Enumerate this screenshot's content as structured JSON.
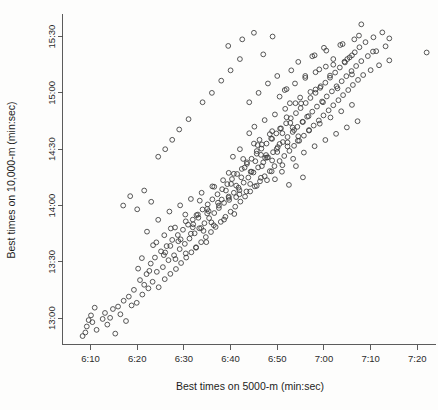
{
  "chart_data": {
    "type": "scatter",
    "title": "",
    "xlabel": "Best times on 5000-m (min:sec)",
    "ylabel": "Best times on 10,000-m (min:sec)",
    "xtick_labels": [
      "6:10",
      "6:20",
      "6:30",
      "6:40",
      "6:50",
      "7:00",
      "7:10",
      "7:20"
    ],
    "xtick_values": [
      370,
      380,
      390,
      400,
      410,
      420,
      430,
      440
    ],
    "ytick_labels": [
      "13:00",
      "13:30",
      "14:00",
      "14:30",
      "15:00",
      "15:30"
    ],
    "ytick_values": [
      780,
      810,
      840,
      870,
      900,
      930
    ],
    "xlim": [
      364,
      444
    ],
    "ylim": [
      766,
      942
    ],
    "grid": false,
    "legend": false,
    "marker": "open-circle",
    "marker_color": "#3a3a3a",
    "n_points": 330,
    "x_units": "seconds (5000-m best time)",
    "y_units": "seconds (10,000-m best time)",
    "points": [
      [
        368.3,
        770.5
      ],
      [
        368.9,
        772.4
      ],
      [
        369.2,
        775.6
      ],
      [
        369.6,
        779.0
      ],
      [
        370.1,
        781.5
      ],
      [
        370.4,
        777.9
      ],
      [
        370.9,
        785.6
      ],
      [
        371.3,
        773.8
      ],
      [
        372.6,
        779.6
      ],
      [
        373.1,
        782.8
      ],
      [
        373.6,
        776.6
      ],
      [
        374.2,
        780.2
      ],
      [
        374.8,
        784.9
      ],
      [
        375.3,
        771.8
      ],
      [
        375.9,
        786.2
      ],
      [
        376.4,
        782.1
      ],
      [
        377.1,
        789.3
      ],
      [
        377.6,
        778.5
      ],
      [
        378.2,
        791.5
      ],
      [
        378.8,
        786.8
      ],
      [
        379.3,
        795.1
      ],
      [
        379.9,
        788.2
      ],
      [
        380.2,
        806.4
      ],
      [
        380.6,
        800.3
      ],
      [
        381.1,
        792.6
      ],
      [
        381.5,
        797.8
      ],
      [
        382.0,
        803.5
      ],
      [
        382.4,
        795.9
      ],
      [
        382.9,
        809.1
      ],
      [
        383.3,
        799.4
      ],
      [
        383.8,
        812.3
      ],
      [
        384.2,
        804.7
      ],
      [
        384.6,
        796.5
      ],
      [
        385.1,
        815.6
      ],
      [
        385.5,
        807.2
      ],
      [
        385.9,
        800.8
      ],
      [
        386.3,
        818.4
      ],
      [
        386.7,
        810.9
      ],
      [
        387.1,
        803.6
      ],
      [
        387.5,
        821.7
      ],
      [
        387.9,
        813.5
      ],
      [
        388.3,
        806.2
      ],
      [
        388.7,
        824.3
      ],
      [
        389.1,
        816.8
      ],
      [
        389.4,
        809.4
      ],
      [
        389.8,
        827.1
      ],
      [
        390.2,
        819.6
      ],
      [
        390.5,
        812.3
      ],
      [
        390.9,
        829.8
      ],
      [
        391.2,
        822.4
      ],
      [
        391.6,
        815.1
      ],
      [
        391.9,
        832.5
      ],
      [
        392.3,
        825.2
      ],
      [
        392.6,
        817.8
      ],
      [
        393.0,
        835.2
      ],
      [
        393.3,
        827.9
      ],
      [
        393.7,
        820.5
      ],
      [
        394.0,
        837.9
      ],
      [
        394.4,
        830.6
      ],
      [
        394.7,
        823.2
      ],
      [
        395.1,
        840.6
      ],
      [
        395.4,
        833.3
      ],
      [
        395.8,
        825.9
      ],
      [
        396.1,
        843.3
      ],
      [
        396.5,
        836.0
      ],
      [
        396.8,
        828.6
      ],
      [
        397.2,
        846.0
      ],
      [
        397.5,
        838.7
      ],
      [
        397.9,
        831.3
      ],
      [
        398.2,
        848.7
      ],
      [
        398.6,
        841.4
      ],
      [
        398.9,
        834.0
      ],
      [
        399.3,
        851.4
      ],
      [
        399.6,
        844.1
      ],
      [
        400.0,
        836.7
      ],
      [
        400.3,
        854.1
      ],
      [
        400.7,
        846.8
      ],
      [
        401.0,
        839.4
      ],
      [
        401.4,
        856.8
      ],
      [
        401.7,
        849.5
      ],
      [
        402.1,
        842.1
      ],
      [
        402.4,
        859.5
      ],
      [
        402.8,
        852.2
      ],
      [
        403.1,
        844.8
      ],
      [
        403.5,
        862.2
      ],
      [
        403.8,
        854.9
      ],
      [
        404.2,
        847.5
      ],
      [
        404.5,
        864.9
      ],
      [
        404.9,
        857.6
      ],
      [
        405.2,
        850.2
      ],
      [
        405.6,
        867.6
      ],
      [
        405.9,
        860.3
      ],
      [
        406.3,
        852.9
      ],
      [
        406.6,
        870.3
      ],
      [
        407.0,
        863.0
      ],
      [
        407.3,
        855.6
      ],
      [
        407.7,
        873.0
      ],
      [
        408.0,
        865.7
      ],
      [
        408.4,
        858.3
      ],
      [
        408.7,
        875.7
      ],
      [
        409.1,
        868.4
      ],
      [
        409.4,
        861.0
      ],
      [
        409.8,
        878.4
      ],
      [
        410.1,
        871.1
      ],
      [
        410.5,
        863.7
      ],
      [
        410.8,
        881.1
      ],
      [
        411.2,
        873.8
      ],
      [
        411.5,
        866.4
      ],
      [
        411.9,
        883.8
      ],
      [
        412.2,
        876.5
      ],
      [
        412.6,
        869.1
      ],
      [
        412.9,
        886.5
      ],
      [
        413.3,
        879.2
      ],
      [
        413.6,
        871.8
      ],
      [
        414.0,
        889.2
      ],
      [
        414.3,
        881.9
      ],
      [
        414.7,
        874.5
      ],
      [
        415.0,
        891.9
      ],
      [
        415.4,
        884.6
      ],
      [
        415.7,
        877.2
      ],
      [
        416.1,
        894.6
      ],
      [
        416.4,
        887.3
      ],
      [
        416.8,
        879.9
      ],
      [
        417.1,
        897.3
      ],
      [
        417.5,
        890.0
      ],
      [
        417.8,
        882.6
      ],
      [
        418.2,
        900.0
      ],
      [
        418.5,
        892.7
      ],
      [
        418.9,
        885.3
      ],
      [
        419.2,
        902.7
      ],
      [
        419.6,
        895.4
      ],
      [
        419.9,
        888.0
      ],
      [
        420.3,
        905.4
      ],
      [
        420.6,
        898.1
      ],
      [
        421.0,
        890.7
      ],
      [
        421.3,
        908.1
      ],
      [
        421.7,
        900.8
      ],
      [
        422.0,
        893.4
      ],
      [
        422.4,
        910.8
      ],
      [
        422.7,
        903.5
      ],
      [
        423.1,
        896.1
      ],
      [
        423.4,
        913.5
      ],
      [
        423.8,
        906.2
      ],
      [
        424.1,
        898.8
      ],
      [
        424.5,
        916.2
      ],
      [
        424.8,
        908.9
      ],
      [
        425.2,
        901.5
      ],
      [
        425.5,
        918.9
      ],
      [
        425.9,
        911.6
      ],
      [
        426.2,
        904.2
      ],
      [
        426.6,
        921.6
      ],
      [
        426.9,
        914.3
      ],
      [
        427.3,
        906.9
      ],
      [
        427.6,
        924.3
      ],
      [
        428.0,
        916.9
      ],
      [
        428.4,
        909.5
      ],
      [
        428.9,
        927.0
      ],
      [
        429.4,
        919.6
      ],
      [
        430.0,
        912.1
      ],
      [
        430.6,
        929.6
      ],
      [
        431.2,
        922.2
      ],
      [
        431.8,
        914.7
      ],
      [
        432.5,
        932.2
      ],
      [
        433.2,
        924.8
      ],
      [
        434.0,
        917.3
      ],
      [
        382.1,
        826.1
      ],
      [
        383.4,
        818.9
      ],
      [
        384.5,
        832.4
      ],
      [
        385.8,
        824.2
      ],
      [
        386.9,
        836.8
      ],
      [
        388.1,
        828.3
      ],
      [
        389.2,
        840.1
      ],
      [
        390.4,
        831.6
      ],
      [
        391.5,
        843.5
      ],
      [
        392.7,
        834.9
      ],
      [
        393.8,
        846.8
      ],
      [
        395.0,
        838.2
      ],
      [
        396.1,
        850.2
      ],
      [
        397.3,
        841.5
      ],
      [
        398.4,
        853.5
      ],
      [
        399.6,
        844.8
      ],
      [
        400.7,
        856.9
      ],
      [
        401.9,
        848.2
      ],
      [
        403.0,
        860.2
      ],
      [
        404.2,
        851.5
      ],
      [
        405.3,
        863.6
      ],
      [
        406.5,
        854.8
      ],
      [
        407.6,
        866.9
      ],
      [
        408.8,
        858.2
      ],
      [
        409.9,
        870.2
      ],
      [
        411.1,
        861.5
      ],
      [
        412.2,
        873.6
      ],
      [
        413.4,
        864.9
      ],
      [
        414.5,
        876.9
      ],
      [
        415.7,
        868.2
      ],
      [
        416.8,
        880.2
      ],
      [
        418.0,
        871.6
      ],
      [
        419.1,
        883.6
      ],
      [
        420.3,
        874.9
      ],
      [
        421.4,
        886.9
      ],
      [
        422.6,
        878.2
      ],
      [
        423.7,
        890.2
      ],
      [
        424.9,
        881.6
      ],
      [
        426.0,
        893.6
      ],
      [
        427.2,
        884.9
      ],
      [
        381.0,
        812.0
      ],
      [
        382.6,
        805.2
      ],
      [
        384.1,
        820.4
      ],
      [
        385.7,
        813.6
      ],
      [
        387.2,
        827.8
      ],
      [
        388.8,
        821.0
      ],
      [
        390.3,
        835.2
      ],
      [
        391.9,
        828.4
      ],
      [
        393.4,
        842.6
      ],
      [
        395.0,
        835.8
      ],
      [
        396.5,
        850.0
      ],
      [
        398.1,
        843.2
      ],
      [
        399.6,
        857.4
      ],
      [
        401.2,
        850.6
      ],
      [
        402.7,
        864.8
      ],
      [
        404.3,
        858.0
      ],
      [
        405.8,
        872.2
      ],
      [
        407.4,
        865.4
      ],
      [
        408.9,
        879.6
      ],
      [
        410.5,
        872.8
      ],
      [
        412.0,
        887.0
      ],
      [
        413.6,
        880.2
      ],
      [
        415.1,
        894.4
      ],
      [
        416.7,
        887.6
      ],
      [
        418.2,
        901.8
      ],
      [
        419.8,
        895.0
      ],
      [
        421.3,
        909.2
      ],
      [
        422.9,
        902.4
      ],
      [
        424.4,
        916.6
      ],
      [
        426.0,
        909.8
      ],
      [
        404.0,
        878.5
      ],
      [
        405.1,
        882.0
      ],
      [
        406.2,
        875.0
      ],
      [
        407.3,
        885.5
      ],
      [
        408.4,
        878.0
      ],
      [
        409.5,
        888.5
      ],
      [
        410.6,
        881.0
      ],
      [
        411.7,
        891.5
      ],
      [
        412.8,
        884.0
      ],
      [
        413.9,
        894.5
      ],
      [
        405.6,
        869.0
      ],
      [
        406.7,
        872.5
      ],
      [
        407.8,
        865.5
      ],
      [
        408.9,
        875.5
      ],
      [
        410.0,
        868.5
      ],
      [
        411.1,
        878.5
      ],
      [
        412.2,
        871.5
      ],
      [
        413.3,
        881.5
      ],
      [
        414.4,
        874.5
      ],
      [
        415.5,
        884.5
      ],
      [
        399.0,
        848.0
      ],
      [
        400.1,
        851.5
      ],
      [
        401.2,
        844.5
      ],
      [
        402.3,
        855.0
      ],
      [
        403.4,
        847.5
      ],
      [
        404.5,
        858.0
      ],
      [
        405.6,
        850.5
      ],
      [
        406.7,
        861.0
      ],
      [
        407.8,
        853.5
      ],
      [
        408.9,
        864.0
      ],
      [
        392.0,
        830.0
      ],
      [
        393.1,
        833.5
      ],
      [
        394.2,
        826.5
      ],
      [
        395.3,
        837.0
      ],
      [
        396.4,
        829.5
      ],
      [
        397.5,
        840.0
      ],
      [
        398.6,
        832.5
      ],
      [
        399.7,
        843.0
      ],
      [
        400.8,
        835.5
      ],
      [
        401.9,
        846.0
      ],
      [
        386.0,
        815.0
      ],
      [
        387.1,
        818.5
      ],
      [
        388.2,
        811.5
      ],
      [
        389.3,
        822.0
      ],
      [
        390.4,
        814.5
      ],
      [
        391.5,
        825.0
      ],
      [
        392.6,
        817.5
      ],
      [
        393.7,
        828.0
      ],
      [
        394.8,
        820.5
      ],
      [
        395.9,
        831.0
      ],
      [
        410.5,
        898.0
      ],
      [
        411.6,
        901.5
      ],
      [
        412.7,
        894.5
      ],
      [
        413.8,
        905.0
      ],
      [
        414.9,
        897.5
      ],
      [
        416.0,
        908.0
      ],
      [
        417.1,
        900.5
      ],
      [
        418.2,
        911.0
      ],
      [
        419.3,
        903.5
      ],
      [
        420.4,
        914.0
      ],
      [
        413.0,
        912.0
      ],
      [
        414.5,
        916.5
      ],
      [
        416.0,
        909.0
      ],
      [
        417.5,
        919.5
      ],
      [
        419.0,
        912.5
      ],
      [
        420.5,
        922.5
      ],
      [
        422.0,
        915.0
      ],
      [
        423.5,
        925.5
      ],
      [
        425.0,
        918.0
      ],
      [
        426.5,
        928.5
      ],
      [
        399.5,
        925.0
      ],
      [
        402.5,
        928.5
      ],
      [
        405.0,
        932.0
      ],
      [
        407.0,
        920.5
      ],
      [
        409.0,
        930.0
      ],
      [
        428.0,
        936.5
      ],
      [
        427.5,
        930.5
      ],
      [
        434.0,
        929.0
      ],
      [
        430.5,
        922.0
      ],
      [
        442.0,
        921.5
      ],
      [
        396.0,
        900.0
      ],
      [
        398.0,
        906.5
      ],
      [
        400.0,
        912.0
      ],
      [
        402.0,
        918.0
      ],
      [
        394.0,
        895.0
      ],
      [
        391.0,
        886.0
      ],
      [
        389.0,
        880.5
      ],
      [
        387.5,
        875.0
      ],
      [
        386.0,
        870.0
      ],
      [
        384.5,
        866.0
      ],
      [
        377.0,
        840.0
      ],
      [
        378.5,
        845.0
      ],
      [
        380.0,
        838.0
      ],
      [
        381.5,
        848.0
      ],
      [
        383.0,
        842.0
      ],
      [
        404.0,
        895.0
      ],
      [
        406.0,
        900.0
      ],
      [
        408.0,
        905.0
      ],
      [
        410.0,
        909.0
      ],
      [
        412.0,
        902.0
      ],
      [
        418.0,
        920.0
      ],
      [
        420.0,
        924.0
      ],
      [
        422.0,
        918.0
      ],
      [
        424.0,
        926.0
      ],
      [
        426.0,
        920.0
      ],
      [
        409.5,
        854.0
      ],
      [
        411.0,
        858.0
      ],
      [
        412.5,
        851.0
      ],
      [
        414.0,
        861.0
      ],
      [
        415.5,
        855.0
      ],
      [
        400.5,
        866.0
      ],
      [
        402.0,
        870.0
      ],
      [
        403.5,
        863.0
      ],
      [
        405.0,
        873.0
      ],
      [
        406.5,
        867.0
      ]
    ]
  },
  "plot": {
    "x_axis_name": "x-axis",
    "y_axis_name": "y-axis"
  }
}
